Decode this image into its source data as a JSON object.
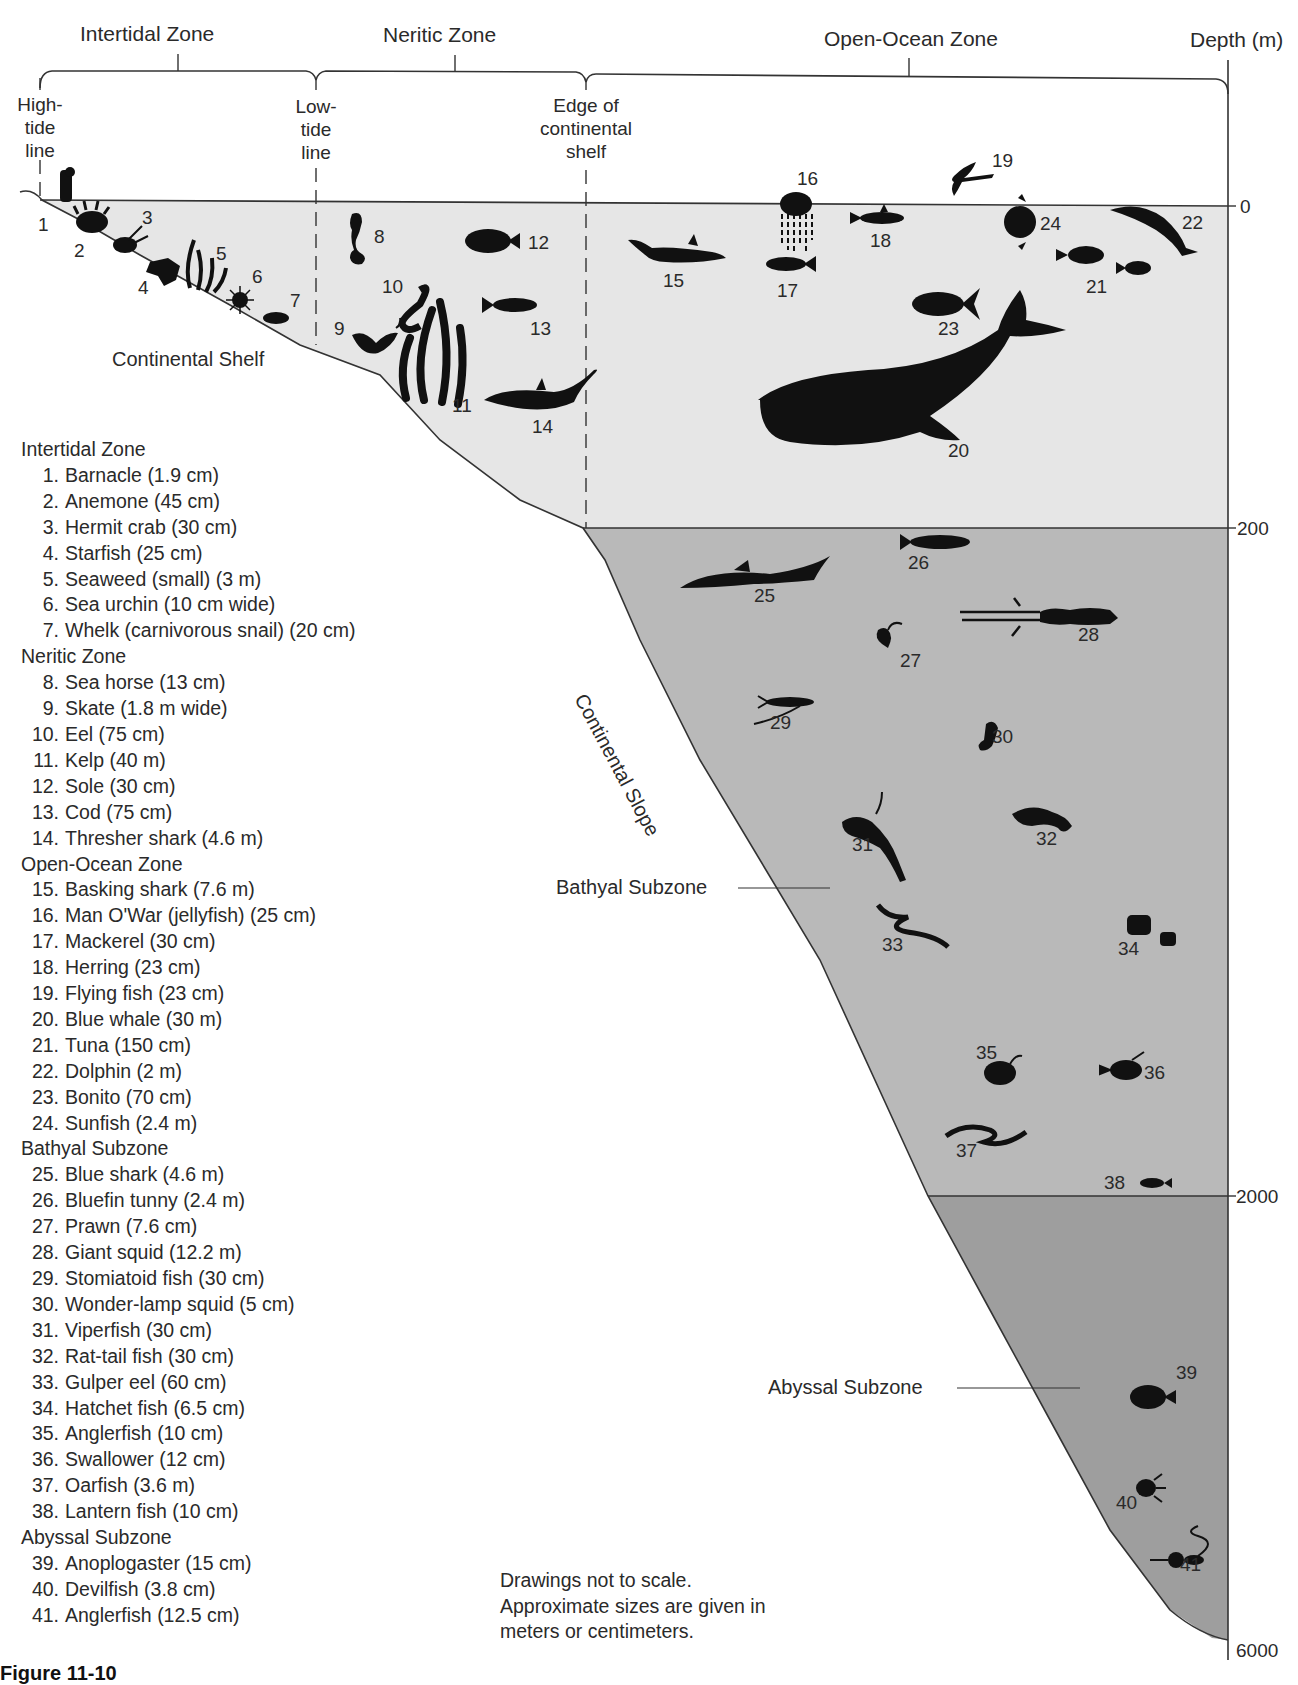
{
  "header": {
    "zones": [
      {
        "label": "Intertidal Zone"
      },
      {
        "label": "Neritic Zone"
      },
      {
        "label": "Open-Ocean Zone"
      }
    ],
    "depth_label": "Depth (m)"
  },
  "markers": {
    "high_tide": "High-\ntide\nline",
    "high_tide_lines": [
      "High-",
      "tide",
      "line"
    ],
    "low_tide_lines": [
      "Low-",
      "tide",
      "line"
    ],
    "shelf_edge_lines": [
      "Edge of",
      "continental",
      "shelf"
    ]
  },
  "depth_ticks": [
    "0",
    "200",
    "2000",
    "6000"
  ],
  "region_labels": {
    "continental_shelf": "Continental Shelf",
    "continental_slope": "Continental Slope",
    "bathyal": "Bathyal Subzone",
    "abyssal": "Abyssal Subzone"
  },
  "colors": {
    "surface_water": "#e6e6e6",
    "bathyal_water": "#b9b9b9",
    "abyssal_water": "#9e9e9e",
    "silhouette": "#111111",
    "line": "#333333"
  },
  "organism_numbers": [
    "1",
    "2",
    "3",
    "4",
    "5",
    "6",
    "7",
    "8",
    "9",
    "10",
    "11",
    "12",
    "13",
    "14",
    "15",
    "16",
    "17",
    "18",
    "19",
    "20",
    "21",
    "22",
    "23",
    "24",
    "25",
    "26",
    "27",
    "28",
    "29",
    "30",
    "31",
    "32",
    "33",
    "34",
    "35",
    "36",
    "37",
    "38",
    "39",
    "40",
    "41"
  ],
  "legend": {
    "intertidal": {
      "title": "Intertidal Zone",
      "items": [
        {
          "n": "1.",
          "text": "Barnacle (1.9 cm)"
        },
        {
          "n": "2.",
          "text": "Anemone (45 cm)"
        },
        {
          "n": "3.",
          "text": "Hermit crab (30 cm)"
        },
        {
          "n": "4.",
          "text": "Starfish (25 cm)"
        },
        {
          "n": "5.",
          "text": "Seaweed (small) (3 m)"
        },
        {
          "n": "6.",
          "text": "Sea urchin (10 cm wide)"
        },
        {
          "n": "7.",
          "text": "Whelk (carnivorous snail) (20 cm)"
        }
      ]
    },
    "neritic": {
      "title": "Neritic Zone",
      "items": [
        {
          "n": "8.",
          "text": "Sea horse (13 cm)"
        },
        {
          "n": "9.",
          "text": "Skate (1.8 m wide)"
        },
        {
          "n": "10.",
          "text": "Eel (75 cm)"
        },
        {
          "n": "11.",
          "text": "Kelp (40 m)"
        },
        {
          "n": "12.",
          "text": "Sole (30 cm)"
        },
        {
          "n": "13.",
          "text": "Cod (75 cm)"
        },
        {
          "n": "14.",
          "text": "Thresher shark (4.6 m)"
        }
      ]
    },
    "open_ocean": {
      "title": "Open-Ocean Zone",
      "items": [
        {
          "n": "15.",
          "text": "Basking shark (7.6 m)"
        },
        {
          "n": "16.",
          "text": "Man O'War (jellyfish) (25 cm)"
        },
        {
          "n": "17.",
          "text": "Mackerel (30 cm)"
        },
        {
          "n": "18.",
          "text": "Herring (23 cm)"
        },
        {
          "n": "19.",
          "text": "Flying fish (23 cm)"
        },
        {
          "n": "20.",
          "text": "Blue whale (30 m)"
        },
        {
          "n": "21.",
          "text": "Tuna (150 cm)"
        },
        {
          "n": "22.",
          "text": "Dolphin (2 m)"
        },
        {
          "n": "23.",
          "text": "Bonito (70 cm)"
        },
        {
          "n": "24.",
          "text": "Sunfish (2.4 m)"
        }
      ]
    },
    "bathyal": {
      "title": "Bathyal Subzone",
      "items": [
        {
          "n": "25.",
          "text": "Blue shark (4.6 m)"
        },
        {
          "n": "26.",
          "text": "Bluefin tunny (2.4 m)"
        },
        {
          "n": "27.",
          "text": "Prawn (7.6 cm)"
        },
        {
          "n": "28.",
          "text": "Giant squid (12.2 m)"
        },
        {
          "n": "29.",
          "text": "Stomiatoid fish (30 cm)"
        },
        {
          "n": "30.",
          "text": "Wonder-lamp squid (5 cm)"
        },
        {
          "n": "31.",
          "text": "Viperfish (30 cm)"
        },
        {
          "n": "32.",
          "text": "Rat-tail fish (30 cm)"
        },
        {
          "n": "33.",
          "text": "Gulper eel (60 cm)"
        },
        {
          "n": "34.",
          "text": "Hatchet fish (6.5 cm)"
        },
        {
          "n": "35.",
          "text": "Anglerfish (10 cm)"
        },
        {
          "n": "36.",
          "text": "Swallower (12 cm)"
        },
        {
          "n": "37.",
          "text": "Oarfish (3.6 m)"
        },
        {
          "n": "38.",
          "text": "Lantern fish (10 cm)"
        }
      ]
    },
    "abyssal": {
      "title": "Abyssal Subzone",
      "items": [
        {
          "n": "39.",
          "text": "Anoplogaster (15 cm)"
        },
        {
          "n": "40.",
          "text": "Devilfish (3.8 cm)"
        },
        {
          "n": "41.",
          "text": "Anglerfish (12.5 cm)"
        }
      ]
    }
  },
  "note": {
    "line1": "Drawings not to scale.",
    "line2": "Approximate sizes are given in",
    "line3": "meters or centimeters."
  },
  "caption": "Figure 11-10"
}
